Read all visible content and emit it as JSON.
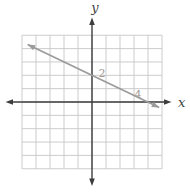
{
  "chart_data": {
    "type": "line",
    "title": "",
    "xlabel": "x",
    "ylabel": "y",
    "xlim": [
      -5,
      5
    ],
    "ylim": [
      -5,
      5
    ],
    "grid": true,
    "grid_step": 1,
    "legend": false,
    "colors": {
      "background": "#ffffff",
      "grid": "#c6c6c6",
      "axis": "#3d3d3d",
      "line": "#9b9b9b",
      "tick_label": "#a29a93",
      "axis_label": "#444444"
    },
    "tick_labels": [
      {
        "text": "2",
        "axis": "y",
        "value": 2
      },
      {
        "text": "4",
        "axis": "x",
        "value": 4
      }
    ],
    "series": [
      {
        "name": "graphed-line",
        "equation": "y = -(1/2)x + 2",
        "slope": -0.5,
        "y_intercept": 2,
        "x_intercept": 4,
        "points_on_line": [
          [
            0,
            2
          ],
          [
            2,
            1
          ],
          [
            4,
            0
          ]
        ],
        "endpoints": [
          [
            -4.6,
            4.3
          ],
          [
            4.8,
            -0.42
          ]
        ],
        "arrowheads": "both"
      }
    ]
  }
}
